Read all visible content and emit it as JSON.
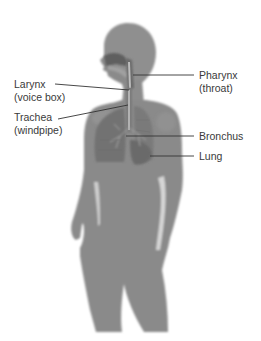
{
  "diagram": {
    "colors": {
      "background": "#ffffff",
      "silhouette": "#8a8a8a",
      "silhouette_light": "#9c9c9c",
      "organ_dark": "#6e6e6e",
      "leader_line": "#333333",
      "text": "#3a3a3a"
    },
    "labels": {
      "larynx": {
        "name": "Larynx",
        "common": "(voice box)"
      },
      "trachea": {
        "name": "Trachea",
        "common": "(windpipe)"
      },
      "pharynx": {
        "name": "Pharynx",
        "common": "(throat)"
      },
      "bronchus": {
        "name": "Bronchus"
      },
      "lung": {
        "name": "Lung"
      }
    }
  }
}
